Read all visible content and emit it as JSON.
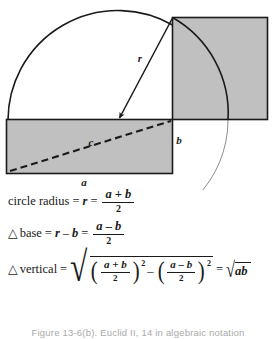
{
  "figure": {
    "diagram_labels": {
      "radius": "r",
      "hypotenuse": "c",
      "short_side": "b",
      "long_side": "a"
    },
    "colors": {
      "shaded_fill": "#c0c0c0",
      "stroke": "#1a1a1a",
      "thin_arc": "#888888",
      "background": "#ffffff"
    }
  },
  "equations": {
    "eq1": {
      "lhs_text": "circle radius",
      "eq1_sign": "=",
      "var_r": "r",
      "eq2_sign": "=",
      "fraction_numerator": "a + b",
      "fraction_denominator": "2"
    },
    "eq2": {
      "triangle_symbol": "△",
      "lhs_text": "base",
      "eq1_sign": "=",
      "var_r": "r",
      "minus": "–",
      "var_b": "b",
      "eq2_sign": "=",
      "fraction_numerator": "a – b",
      "fraction_denominator": "2"
    },
    "eq3": {
      "triangle_symbol": "△",
      "lhs_text": "vertical",
      "eq1_sign": "=",
      "radical_symbol": "√",
      "open_paren": "(",
      "close_paren": ")",
      "frac1_numerator": "a + b",
      "frac1_denominator": "2",
      "exponent1": "2",
      "minus": "–",
      "frac2_numerator": "a – b",
      "frac2_denominator": "2",
      "exponent2": "2",
      "eq2_sign": "=",
      "result_radicand": "ab"
    }
  },
  "caption": {
    "text": "Figure 13-6(b). Euclid II, 14 in algebraic notation"
  }
}
